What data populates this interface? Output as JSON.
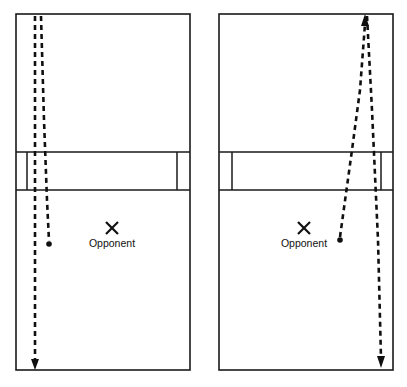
{
  "figure": {
    "type": "diagram",
    "background_color": "#ffffff",
    "line_color": "#101010",
    "panel_count": 2
  },
  "court_geometry": {
    "description": "Badminton court viewed from above; net band across the middle",
    "left_panel": {
      "outer_left_x": 16,
      "outer_right_x": 190,
      "top_y": 14,
      "bottom_y": 370,
      "net_top_y": 152,
      "net_bottom_y": 190,
      "inner_left_x": 27,
      "inner_right_x": 177,
      "tramline_side": "left-and-right"
    },
    "right_panel": {
      "outer_left_x": 219,
      "outer_right_x": 393,
      "top_y": 14,
      "bottom_y": 370,
      "net_top_y": 152,
      "net_bottom_y": 190,
      "inner_left_x": 232,
      "inner_right_x": 381,
      "tramline_side": "left-and-right"
    }
  },
  "panels": [
    {
      "id": "panel-left",
      "name": "left-court-diagram",
      "opponent_marker": {
        "label": "Opponent",
        "x_mark_cx": 112,
        "x_mark_cy": 228,
        "label_x": 112,
        "label_y": 246,
        "marker_glyph": "X"
      },
      "shuttle_dot": {
        "cx": 49,
        "cy": 244,
        "r": 2.6
      },
      "trajectories": [
        {
          "name": "incoming-shot",
          "style": "dashed",
          "has_arrow_head": false,
          "points": "41,16 44,120 47,200 49,241"
        },
        {
          "name": "return-shot-straight-down-line",
          "style": "dashed",
          "has_arrow_head": true,
          "arrow_at": "end",
          "arrow_x": 35,
          "arrow_y": 368,
          "points": "35,16 35,120 35,240 35,362"
        }
      ]
    },
    {
      "id": "panel-right",
      "name": "right-court-diagram",
      "opponent_marker": {
        "label": "Opponent",
        "x_mark_cx": 304,
        "x_mark_cy": 228,
        "label_x": 304,
        "label_y": 246,
        "marker_glyph": "X"
      },
      "shuttle_dot": {
        "cx": 340,
        "cy": 240,
        "r": 2.6
      },
      "trajectories": [
        {
          "name": "incoming-cross-court-shot",
          "style": "dashed",
          "has_arrow_head": true,
          "arrow_at": "start",
          "arrow_x": 365,
          "arrow_y": 16,
          "points": "340,237 352,150 360,90 365,22"
        },
        {
          "name": "return-shot-straight-down-line",
          "style": "dashed",
          "has_arrow_head": true,
          "arrow_at": "end",
          "arrow_x": 381,
          "arrow_y": 366,
          "points": "367,16 372,110 378,240 381,360"
        }
      ]
    }
  ],
  "labels": {
    "opponent": "Opponent"
  }
}
